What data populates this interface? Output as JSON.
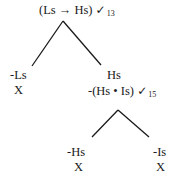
{
  "tree": {
    "root": {
      "formula": "(Ls → Hs)",
      "check": "✓",
      "line": "13"
    },
    "left_branch": {
      "formula": "-Ls",
      "closed": "X"
    },
    "right_branch": {
      "formula1": "Hs",
      "formula2": "-(Hs • Is)",
      "check": "✓",
      "line": "15",
      "children": [
        {
          "formula": "-Hs",
          "closed": "X"
        },
        {
          "formula": "-Is",
          "closed": "X"
        }
      ]
    }
  }
}
